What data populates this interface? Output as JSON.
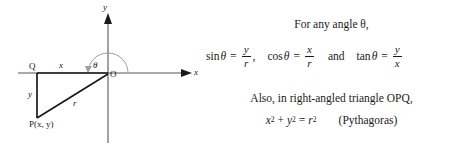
{
  "figure": {
    "type": "trigonometry-unit-diagram",
    "diagram": {
      "axis_labels": {
        "x": "x",
        "y": "y"
      },
      "origin_label": "O",
      "points": [
        {
          "name": "Q",
          "label": "Q",
          "x": 37,
          "y": 73
        },
        {
          "name": "O",
          "label": "O",
          "x": 108,
          "y": 73
        },
        {
          "name": "P",
          "label": "P(x, y)",
          "x": 37,
          "y": 118
        }
      ],
      "side_labels": {
        "horizontal": "x",
        "vertical": "y",
        "hypotenuse": "r"
      },
      "angle_label": "θ",
      "arc": {
        "center": [
          108,
          73
        ],
        "radius": 20,
        "from_degrees": 0,
        "to_degrees": 180
      },
      "colors": {
        "stroke": "#1a1a1a",
        "axis": "#4a4a4a",
        "arc": "#9a9a9a",
        "background": "#ffffff"
      }
    },
    "text": {
      "intro": "For any angle θ,",
      "sin": {
        "name": "sin",
        "arg": "θ",
        "equals": "=",
        "numerator": "y",
        "denominator": "r",
        "trailing": ","
      },
      "cos": {
        "name": "cos",
        "arg": "θ",
        "equals": "=",
        "numerator": "x",
        "denominator": "r"
      },
      "conjunction": "and",
      "tan": {
        "name": "tan",
        "arg": "θ",
        "equals": "=",
        "numerator": "y",
        "denominator": "x"
      },
      "also": "Also, in right-angled triangle OPQ,",
      "pythagoras": {
        "base_x": "x",
        "base_y": "y",
        "base_r": "r",
        "exponent": "2",
        "plus": "+",
        "equals": "=",
        "note": "(Pythagoras)"
      }
    }
  }
}
